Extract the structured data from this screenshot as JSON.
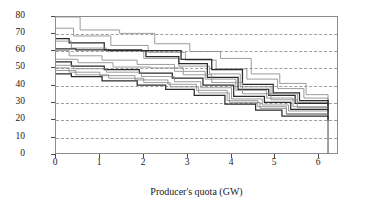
{
  "chart_data": {
    "type": "line",
    "subtype": "step-post",
    "title": "",
    "xlabel": "Producer's quota (GW)",
    "ylabel": "Price (€/MWh)",
    "xlim": [
      0,
      6.45
    ],
    "ylim": [
      0,
      80
    ],
    "xticks": [
      0,
      1,
      2,
      3,
      4,
      5,
      6
    ],
    "yticks": [
      0,
      10,
      20,
      30,
      40,
      50,
      60,
      70,
      80
    ],
    "xticklabels": [
      "0",
      "1",
      "2",
      "3",
      "4",
      "5",
      "6"
    ],
    "yticklabels": [
      "0",
      "10",
      "20",
      "30",
      "40",
      "50",
      "60",
      "70",
      "80"
    ],
    "grid": "horizontal-dashed",
    "legend": "none",
    "colors": {
      "frame": "#8c8c8c",
      "grid": "#9a9a9a",
      "curve_light": "#8a8a8a",
      "curve_dark": "#2b2b2b",
      "background": "#ffffff"
    },
    "series": [
      {
        "name": "curve-1",
        "shade": "light",
        "x": [
          0.0,
          0.55,
          1.45,
          2.25,
          3.05,
          3.75,
          4.45,
          5.1,
          5.7,
          6.2
        ],
        "y": [
          80.0,
          72.5,
          70.5,
          64.5,
          60.0,
          56.0,
          47.0,
          41.5,
          35.0,
          31.0
        ]
      },
      {
        "name": "curve-2",
        "shade": "light",
        "x": [
          0.0,
          0.4,
          1.25,
          2.1,
          2.95,
          3.65,
          4.35,
          5.05,
          5.65,
          6.2
        ],
        "y": [
          73.5,
          69.0,
          63.5,
          59.5,
          55.0,
          50.0,
          44.0,
          38.5,
          33.0,
          29.5
        ]
      },
      {
        "name": "curve-3",
        "shade": "dark",
        "x": [
          0.0,
          0.3,
          1.1,
          1.95,
          2.85,
          3.55,
          4.25,
          4.95,
          5.55,
          6.2
        ],
        "y": [
          67.5,
          65.0,
          61.0,
          60.5,
          55.5,
          49.5,
          41.0,
          36.0,
          31.5,
          28.5
        ]
      },
      {
        "name": "curve-4",
        "shade": "light",
        "x": [
          0.0,
          0.35,
          1.15,
          2.0,
          2.8,
          3.5,
          4.2,
          4.9,
          5.5,
          6.2
        ],
        "y": [
          66.0,
          62.0,
          60.5,
          56.0,
          51.5,
          47.0,
          39.5,
          35.5,
          30.5,
          27.0
        ]
      },
      {
        "name": "curve-5",
        "shade": "dark",
        "x": [
          0.0,
          0.45,
          1.2,
          2.05,
          2.8,
          3.45,
          4.15,
          4.85,
          5.45,
          6.2
        ],
        "y": [
          61.5,
          61.0,
          60.5,
          57.0,
          53.0,
          45.0,
          38.0,
          34.5,
          30.0,
          26.0
        ]
      },
      {
        "name": "curve-6",
        "shade": "light",
        "x": [
          0.0,
          0.3,
          1.05,
          1.85,
          2.7,
          3.4,
          4.1,
          4.8,
          5.4,
          6.2
        ],
        "y": [
          60.5,
          57.5,
          55.0,
          52.5,
          48.5,
          44.0,
          37.5,
          33.0,
          28.0,
          25.0
        ]
      },
      {
        "name": "curve-7",
        "shade": "light",
        "x": [
          0.0,
          0.5,
          1.3,
          2.15,
          2.9,
          3.55,
          4.25,
          4.9,
          5.5,
          6.2
        ],
        "y": [
          55.5,
          53.5,
          51.0,
          50.5,
          46.5,
          42.0,
          35.5,
          32.0,
          27.5,
          24.5
        ]
      },
      {
        "name": "curve-8",
        "shade": "dark",
        "x": [
          0.0,
          0.35,
          1.1,
          1.9,
          2.65,
          3.35,
          4.05,
          4.75,
          5.35,
          6.2
        ],
        "y": [
          54.0,
          51.5,
          49.5,
          47.5,
          44.5,
          40.5,
          34.0,
          30.5,
          26.5,
          23.5
        ]
      },
      {
        "name": "curve-9",
        "shade": "light",
        "x": [
          0.0,
          0.4,
          1.15,
          1.95,
          2.7,
          3.3,
          4.0,
          4.7,
          5.3,
          6.2
        ],
        "y": [
          52.0,
          50.0,
          48.0,
          45.5,
          42.5,
          39.0,
          32.5,
          29.0,
          25.5,
          22.5
        ]
      },
      {
        "name": "curve-10",
        "shade": "light",
        "x": [
          0.0,
          0.3,
          1.0,
          1.8,
          2.55,
          3.2,
          3.9,
          4.6,
          5.25,
          6.2
        ],
        "y": [
          50.5,
          48.0,
          46.0,
          43.5,
          41.0,
          37.5,
          31.5,
          28.0,
          24.0,
          21.5
        ]
      },
      {
        "name": "curve-11",
        "shade": "light",
        "x": [
          0.0,
          0.45,
          1.2,
          2.0,
          2.6,
          3.25,
          3.95,
          4.65,
          5.25,
          6.2
        ],
        "y": [
          49.0,
          46.5,
          44.5,
          42.0,
          39.5,
          36.0,
          30.5,
          27.0,
          23.5,
          21.0
        ]
      },
      {
        "name": "curve-12",
        "shade": "dark",
        "x": [
          0.0,
          0.35,
          1.05,
          1.85,
          2.5,
          3.15,
          3.85,
          4.55,
          5.15,
          6.2
        ],
        "y": [
          47.0,
          45.5,
          43.0,
          40.5,
          38.0,
          34.5,
          29.5,
          26.0,
          22.5,
          20.0
        ]
      }
    ]
  },
  "axes": {
    "y_label": "Price (€/MWh)",
    "x_label": "Producer's quota (GW)"
  }
}
